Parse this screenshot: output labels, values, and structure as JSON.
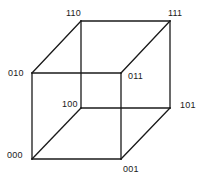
{
  "diagram": {
    "title": "",
    "type": "binary-cube",
    "vertices": [
      {
        "id": "000",
        "label": "000",
        "x": 32,
        "y": 159,
        "label_x": 7,
        "label_y": 150
      },
      {
        "id": "001",
        "label": "001",
        "x": 121,
        "y": 159,
        "label_x": 123,
        "label_y": 164
      },
      {
        "id": "010",
        "label": "010",
        "x": 32,
        "y": 73,
        "label_x": 8,
        "label_y": 68
      },
      {
        "id": "011",
        "label": "011",
        "x": 121,
        "y": 73,
        "label_x": 128,
        "label_y": 71
      },
      {
        "id": "100",
        "label": "100",
        "x": 81,
        "y": 108,
        "label_x": 62,
        "label_y": 99
      },
      {
        "id": "101",
        "label": "101",
        "x": 170,
        "y": 108,
        "label_x": 180,
        "label_y": 100
      },
      {
        "id": "110",
        "label": "110",
        "x": 81,
        "y": 21,
        "label_x": 66,
        "label_y": 8
      },
      {
        "id": "111",
        "label": "111",
        "x": 170,
        "y": 21,
        "label_x": 168,
        "label_y": 8
      }
    ],
    "edges": [
      [
        "000",
        "001"
      ],
      [
        "000",
        "010"
      ],
      [
        "001",
        "011"
      ],
      [
        "010",
        "011"
      ],
      [
        "100",
        "101"
      ],
      [
        "100",
        "110"
      ],
      [
        "101",
        "111"
      ],
      [
        "110",
        "111"
      ],
      [
        "000",
        "100"
      ],
      [
        "001",
        "101"
      ],
      [
        "010",
        "110"
      ],
      [
        "011",
        "111"
      ]
    ],
    "colors": {
      "line": "#1a1a1a",
      "text": "#1a1a1a",
      "background": "#ffffff"
    }
  }
}
